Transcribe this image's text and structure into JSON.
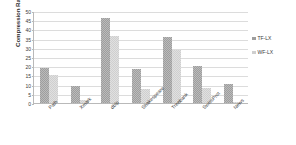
{
  "chart_data": {
    "type": "bar",
    "title": "",
    "xlabel": "",
    "ylabel": "Compression Ratio (%)",
    "categories": [
      "Path",
      "Xmark",
      "dblp",
      "Shakespeare",
      "Treebank",
      "SwissProt",
      "News"
    ],
    "series": [
      {
        "name": "TF-LX",
        "color": "#9e9e9e",
        "values": [
          19.0,
          9.3,
          46.0,
          18.3,
          36.0,
          20.0,
          10.3
        ]
      },
      {
        "name": "WF-LX",
        "color": "#cfcfcf",
        "values": [
          15.0,
          1.5,
          36.5,
          7.7,
          29.0,
          8.0,
          0.8
        ]
      }
    ],
    "ylim": [
      0,
      50
    ],
    "yticks": [
      0,
      5,
      10,
      15,
      20,
      25,
      30,
      35,
      40,
      45,
      50
    ],
    "ytick_labels": [
      "0",
      "5",
      "10",
      "15",
      "20",
      "25",
      "30",
      "35",
      "40",
      "45",
      "50"
    ],
    "grid": true,
    "legend_position": "right",
    "axis_color": "#b9b9b9",
    "grid_color": "#dcdcdc",
    "background": "#ffffff"
  }
}
